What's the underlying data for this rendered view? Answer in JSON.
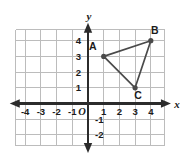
{
  "chart_data": {
    "type": "scatter",
    "title": "",
    "xlabel": "x",
    "ylabel": "y",
    "xlim": [
      -4.6,
      4.9
    ],
    "ylim": [
      -2.7,
      4.7
    ],
    "grid": true,
    "legend": null,
    "origin_label": "O",
    "x_ticks": [
      {
        "value": -4,
        "label": "-4"
      },
      {
        "value": -3,
        "label": "-3"
      },
      {
        "value": -2,
        "label": "-2"
      },
      {
        "value": -1,
        "label": "-1"
      },
      {
        "value": 1,
        "label": "1"
      },
      {
        "value": 2,
        "label": "2"
      },
      {
        "value": 3,
        "label": "3"
      },
      {
        "value": 4,
        "label": "4"
      }
    ],
    "y_ticks": [
      {
        "value": 4,
        "label": "4"
      },
      {
        "value": 3,
        "label": "3"
      },
      {
        "value": 2,
        "label": "2"
      },
      {
        "value": 1,
        "label": "1"
      },
      {
        "value": -1,
        "label": "-1"
      },
      {
        "value": -2,
        "label": "-2"
      }
    ],
    "points": [
      {
        "name": "A",
        "x": 1,
        "y": 3,
        "label": "A",
        "label_dx": -11,
        "label_dy": -6
      },
      {
        "name": "B",
        "x": 4,
        "y": 4,
        "label": "B",
        "label_dx": 4,
        "label_dy": -7
      },
      {
        "name": "C",
        "x": 3,
        "y": 1,
        "label": "C",
        "label_dx": 3,
        "label_dy": 11
      }
    ],
    "polygon": [
      "A",
      "B",
      "C"
    ],
    "colors": {
      "grid": "#bcbcbc",
      "axis": "#2b2b2b",
      "shape_stroke": "#4a4a4a",
      "text": "#1b1b1b",
      "background": "#ffffff"
    }
  }
}
